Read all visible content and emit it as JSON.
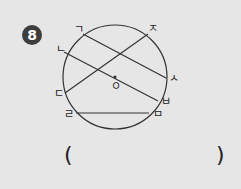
{
  "problem_number": "8",
  "diagram": {
    "center_label": "ㅇ",
    "points": [
      {
        "label": "ㄱ",
        "x": 83,
        "y": 34
      },
      {
        "label": "ㄴ",
        "x": 64,
        "y": 52
      },
      {
        "label": "ㄷ",
        "x": 65,
        "y": 93
      },
      {
        "label": "ㄹ",
        "x": 76,
        "y": 113
      },
      {
        "label": "ㅁ",
        "x": 149,
        "y": 113
      },
      {
        "label": "ㅂ",
        "x": 158,
        "y": 101
      },
      {
        "label": "ㅅ",
        "x": 166,
        "y": 78
      },
      {
        "label": "ㅈ",
        "x": 148,
        "y": 34
      }
    ],
    "segments": [
      [
        "ㄱ",
        "ㅅ"
      ],
      [
        "ㄴ",
        "ㅂ"
      ],
      [
        "ㄷ",
        "ㅈ"
      ],
      [
        "ㄹ",
        "ㅁ"
      ]
    ]
  },
  "answer": {
    "open_paren": "(",
    "close_paren": ")"
  }
}
